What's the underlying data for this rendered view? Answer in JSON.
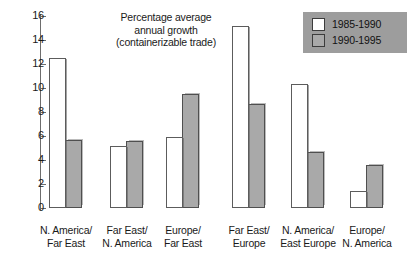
{
  "chart_data": {
    "type": "bar",
    "title_lines": [
      "Percentage average",
      "annual growth",
      "(containerizable trade)"
    ],
    "xlabel": "",
    "ylabel": "",
    "ylim": [
      0,
      16
    ],
    "ytick_values": [
      0,
      2,
      4,
      6,
      8,
      10,
      12,
      14,
      16
    ],
    "ytick_labels": [
      "0",
      "2",
      "4",
      "6",
      "8",
      "10",
      "12",
      "14",
      "16"
    ],
    "grid": false,
    "legend_position": "top-right",
    "categories": [
      "N. America/ Far East",
      "Far East/ N. America",
      "Europe/ Far East",
      "Far East/ Europe",
      "N. America/ East Europe",
      "Europe/ N. America"
    ],
    "category_lines": [
      [
        "N. America/",
        "Far East"
      ],
      [
        "Far East/",
        "N. America"
      ],
      [
        "Europe/",
        "Far East"
      ],
      [
        "Far East/",
        "Europe"
      ],
      [
        "N. America/",
        "East Europe"
      ],
      [
        "Europe/",
        "N. America"
      ]
    ],
    "series": [
      {
        "name": "1985-1990",
        "color": "#ffffff",
        "values": [
          12.5,
          5.2,
          5.9,
          15.2,
          10.3,
          1.4
        ]
      },
      {
        "name": "1990-1995",
        "color": "#a9a9a9",
        "values": [
          5.7,
          5.6,
          9.5,
          8.7,
          4.7,
          3.6
        ]
      }
    ]
  },
  "legend": {
    "background_color": "#9d9d9d",
    "entries": [
      {
        "label": "1985-1990",
        "swatch": "white"
      },
      {
        "label": "1990-1995",
        "swatch": "gray"
      }
    ]
  }
}
